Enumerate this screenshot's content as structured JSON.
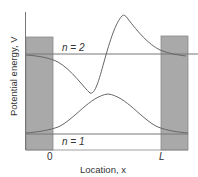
{
  "diagram": {
    "type": "finite-square-well-wavefunctions",
    "y_axis_label": "Potential energy, V",
    "x_axis_label": "Location, x",
    "x_ticks": {
      "left": "0",
      "right": "L"
    },
    "levels": [
      {
        "name": "n = 1",
        "label": "n = 1"
      },
      {
        "name": "n = 2",
        "label": "n = 2"
      }
    ],
    "colors": {
      "barrier_fill": "#a9a9a9",
      "barrier_stroke": "#777777",
      "line": "#777777",
      "curve": "#666666",
      "text": "#333333"
    }
  }
}
